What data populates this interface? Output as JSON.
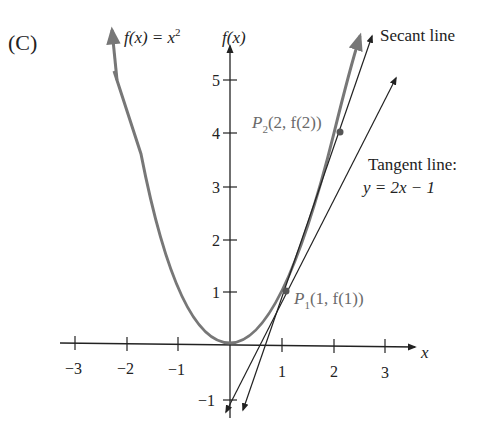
{
  "panel_label": "(C)",
  "function_label": {
    "lhs": "f(x) = x",
    "exp": "2"
  },
  "y_axis_label": "f(x)",
  "x_axis_label": "x",
  "x_ticks": [
    "−3",
    "−2",
    "−1",
    "1",
    "2",
    "3"
  ],
  "y_ticks": [
    "5",
    "4",
    "3",
    "2",
    "1",
    "−1"
  ],
  "secant_label": "Secant line",
  "tangent_label": {
    "line1": "Tangent line:",
    "line2": "y = 2x − 1"
  },
  "points": {
    "p2": {
      "name": "P",
      "sub": "2",
      "coords": "(2, f(2))"
    },
    "p1": {
      "name": "P",
      "sub": "1",
      "coords": "(1, f(1))"
    }
  },
  "colors": {
    "curve": "#777777",
    "axes": "#222222",
    "lines": "#222222",
    "point_label": "#6a6a6a"
  },
  "diagram_data": {
    "curve": "f(x) = x^2",
    "secant": {
      "through": [
        [
          1,
          1
        ],
        [
          2,
          4
        ]
      ],
      "equation": "y = 3x - 2"
    },
    "tangent": {
      "at": [
        1,
        1
      ],
      "equation": "y = 2x - 1"
    },
    "xlim": [
      -3,
      3
    ],
    "ylim": [
      -1,
      5
    ]
  }
}
